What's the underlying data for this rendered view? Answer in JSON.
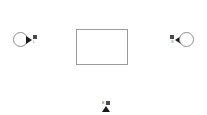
{
  "scene": {
    "background_color": "#ffffff",
    "plane": {
      "name": "center-plane",
      "border_color": "#9b9b9b",
      "fill_color": "#ffffff"
    },
    "markers": [
      {
        "id": "left-camera",
        "position": "left",
        "orientation": "facing-right",
        "label": "L",
        "cone_color": "#1a1a1a",
        "circle_color": "#8e8e8e"
      },
      {
        "id": "right-camera",
        "position": "right",
        "orientation": "facing-left",
        "label": "R",
        "cone_color": "#1a1a1a",
        "circle_color": "#8e8e8e"
      },
      {
        "id": "bottom-camera",
        "position": "bottom",
        "orientation": "facing-up",
        "label": "B",
        "cone_color": "#1a1a1a"
      }
    ]
  }
}
